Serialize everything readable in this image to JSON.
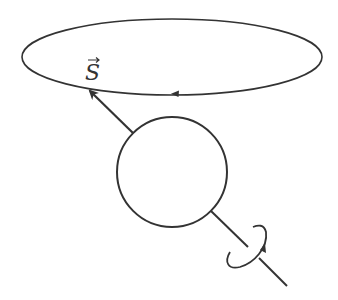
{
  "diagram": {
    "type": "spin-precession",
    "labels": {
      "spin_vector": "S"
    },
    "elements": {
      "precession_orbit": {
        "cx": 172,
        "cy": 57,
        "rx": 150,
        "ry": 38,
        "direction": "counterclockwise-from-above"
      },
      "body": {
        "cx": 172,
        "cy": 172,
        "r": 55
      },
      "spin_axis": {
        "from": [
          287,
          286
        ],
        "to": [
          88,
          89
        ]
      },
      "rotation_indicator": {
        "cx": 252,
        "cy": 255
      }
    },
    "colors": {
      "stroke": "#333333",
      "background": "#ffffff"
    }
  }
}
